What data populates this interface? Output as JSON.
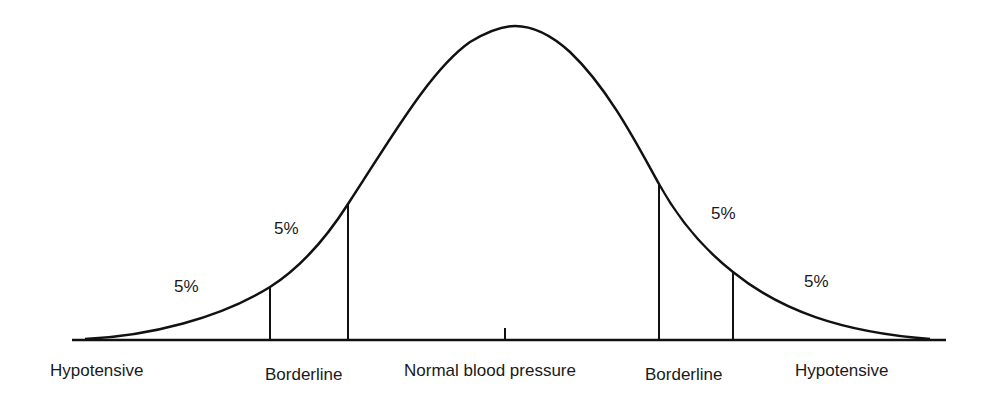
{
  "diagram": {
    "title": "",
    "type": "normal distribution curve",
    "curve": {
      "peak": {
        "x": 515,
        "y": 26
      },
      "baseline_y": 340,
      "baseline_x_range": [
        72,
        946
      ],
      "stroke_color": "#111111"
    },
    "dividers": [
      {
        "id": "left-outer",
        "x": 270,
        "top_y": 287
      },
      {
        "id": "left-inner",
        "x": 348,
        "top_y": 204
      },
      {
        "id": "center-tick",
        "x": 505,
        "top_y": 328
      },
      {
        "id": "right-inner",
        "x": 659,
        "top_y": 184
      },
      {
        "id": "right-outer",
        "x": 733,
        "top_y": 272
      }
    ],
    "percent_labels": [
      {
        "text": "5%",
        "region": "left-tail"
      },
      {
        "text": "5%",
        "region": "left-borderline"
      },
      {
        "text": "5%",
        "region": "right-borderline"
      },
      {
        "text": "5%",
        "region": "right-tail"
      }
    ],
    "axis_labels": [
      {
        "text": "Hypotensive",
        "position": "far-left"
      },
      {
        "text": "Borderline",
        "position": "left"
      },
      {
        "text": "Normal blood pressure",
        "position": "center"
      },
      {
        "text": "Borderline",
        "position": "right"
      },
      {
        "text": "Hypotensive",
        "position": "far-right"
      }
    ]
  }
}
